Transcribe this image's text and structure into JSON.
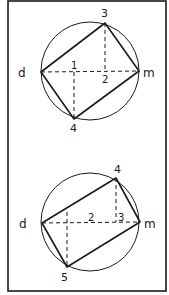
{
  "colors": {
    "ink": "#1a1a1a",
    "background": "#ffffff"
  },
  "frame": {
    "x": 8,
    "y": 1,
    "width": 158,
    "height": 290
  },
  "diagrams": [
    {
      "id": "top",
      "circle": {
        "cx": 90,
        "cy": 71,
        "r": 49
      },
      "points": {
        "d": {
          "x": 41,
          "y": 72,
          "label": "d"
        },
        "m": {
          "x": 139,
          "y": 71,
          "label": "m"
        },
        "p3": {
          "x": 105,
          "y": 23,
          "label": "3"
        },
        "p4": {
          "x": 74,
          "y": 119,
          "label": "4"
        }
      },
      "axis_labels": [
        {
          "text": "1",
          "x": 74,
          "y": 67
        },
        {
          "text": "2",
          "x": 105,
          "y": 85
        }
      ]
    },
    {
      "id": "bottom",
      "circle": {
        "cx": 90,
        "cy": 222,
        "r": 49
      },
      "points": {
        "d": {
          "x": 42,
          "y": 223,
          "label": "d"
        },
        "m": {
          "x": 140,
          "y": 222,
          "label": "m"
        },
        "p4": {
          "x": 116,
          "y": 178,
          "label": "4"
        },
        "p5": {
          "x": 67,
          "y": 267,
          "label": "5"
        }
      },
      "axis_labels": [
        {
          "text": "2",
          "x": 91,
          "y": 220
        },
        {
          "text": "3",
          "x": 119,
          "y": 220
        }
      ]
    }
  ],
  "labels": {
    "top_d": "d",
    "top_m": "m",
    "top_3": "3",
    "top_4": "4",
    "top_1": "1",
    "top_2": "2",
    "bot_d": "d",
    "bot_m": "m",
    "bot_4": "4",
    "bot_5": "5",
    "bot_2": "2",
    "bot_3": "3"
  }
}
